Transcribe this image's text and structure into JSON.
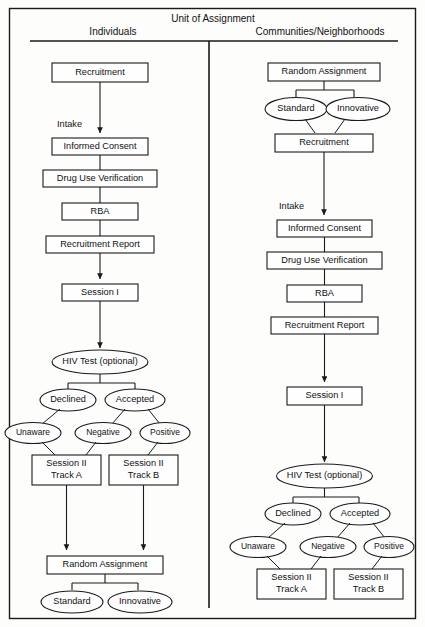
{
  "figure": {
    "title": "Unit of Assignment",
    "columns": [
      {
        "id": "individuals",
        "header": "Individuals"
      },
      {
        "id": "communities",
        "header": "Communities/Neighborhoods"
      }
    ]
  },
  "labels": {
    "intake_left": "Intake",
    "intake_right": "Intake"
  },
  "left_column": {
    "nodes": [
      {
        "id": "l-recruitment",
        "shape": "box",
        "text": "Recruitment"
      },
      {
        "id": "l-informed-consent",
        "shape": "box",
        "text": "Informed Consent"
      },
      {
        "id": "l-drug-use-verification",
        "shape": "box",
        "text": "Drug Use Verification"
      },
      {
        "id": "l-rba",
        "shape": "box",
        "text": "RBA"
      },
      {
        "id": "l-recruitment-report",
        "shape": "box",
        "text": "Recruitment Report"
      },
      {
        "id": "l-session-i",
        "shape": "box",
        "text": "Session I"
      },
      {
        "id": "l-hiv-test",
        "shape": "ellipse",
        "text": "HIV Test (optional)"
      },
      {
        "id": "l-declined",
        "shape": "ellipse",
        "text": "Declined"
      },
      {
        "id": "l-accepted",
        "shape": "ellipse",
        "text": "Accepted"
      },
      {
        "id": "l-unaware",
        "shape": "ellipse",
        "text": "Unaware"
      },
      {
        "id": "l-negative",
        "shape": "ellipse",
        "text": "Negative"
      },
      {
        "id": "l-positive",
        "shape": "ellipse",
        "text": "Positive"
      },
      {
        "id": "l-session-ii-a",
        "shape": "box",
        "text": "Session II",
        "text2": "Track A"
      },
      {
        "id": "l-session-ii-b",
        "shape": "box",
        "text": "Session II",
        "text2": "Track B"
      },
      {
        "id": "l-random-assignment",
        "shape": "box",
        "text": "Random Assignment"
      },
      {
        "id": "l-standard",
        "shape": "ellipse",
        "text": "Standard"
      },
      {
        "id": "l-innovative",
        "shape": "ellipse",
        "text": "Innovative"
      }
    ]
  },
  "right_column": {
    "nodes": [
      {
        "id": "r-random-assignment",
        "shape": "box",
        "text": "Random Assignment"
      },
      {
        "id": "r-standard",
        "shape": "ellipse",
        "text": "Standard"
      },
      {
        "id": "r-innovative",
        "shape": "ellipse",
        "text": "Innovative"
      },
      {
        "id": "r-recruitment",
        "shape": "box",
        "text": "Recruitment"
      },
      {
        "id": "r-informed-consent",
        "shape": "box",
        "text": "Informed Consent"
      },
      {
        "id": "r-drug-use-verification",
        "shape": "box",
        "text": "Drug Use Verification"
      },
      {
        "id": "r-rba",
        "shape": "box",
        "text": "RBA"
      },
      {
        "id": "r-recruitment-report",
        "shape": "box",
        "text": "Recruitment Report"
      },
      {
        "id": "r-session-i",
        "shape": "box",
        "text": "Session I"
      },
      {
        "id": "r-hiv-test",
        "shape": "ellipse",
        "text": "HIV Test (optional)"
      },
      {
        "id": "r-declined",
        "shape": "ellipse",
        "text": "Declined"
      },
      {
        "id": "r-accepted",
        "shape": "ellipse",
        "text": "Accepted"
      },
      {
        "id": "r-unaware",
        "shape": "ellipse",
        "text": "Unaware"
      },
      {
        "id": "r-negative",
        "shape": "ellipse",
        "text": "Negative"
      },
      {
        "id": "r-positive",
        "shape": "ellipse",
        "text": "Positive"
      },
      {
        "id": "r-session-ii-a",
        "shape": "box",
        "text": "Session II",
        "text2": "Track A"
      },
      {
        "id": "r-session-ii-b",
        "shape": "box",
        "text": "Session II",
        "text2": "Track B"
      }
    ]
  },
  "colors": {
    "stroke": "#1a1a1a",
    "fill": "#fefefe",
    "background": "#fdfdfc"
  }
}
